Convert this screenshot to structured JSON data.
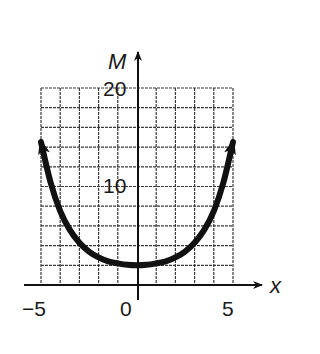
{
  "chart_data": {
    "type": "line",
    "title": "",
    "xlabel": "x",
    "ylabel": "M",
    "xlim": [
      -5,
      5
    ],
    "ylim": [
      0,
      20
    ],
    "grid": true,
    "grid_step_x": 1,
    "grid_step_y": 2,
    "x_tick_labels": [
      "−5",
      "0",
      "5"
    ],
    "y_tick_labels": [
      "10",
      "20"
    ],
    "series": [
      {
        "name": "M(x)",
        "x": [
          -5,
          -4.5,
          -4,
          -3.5,
          -3,
          -2.5,
          -2,
          -1.5,
          -1,
          -0.5,
          0,
          0.5,
          1,
          1.5,
          2,
          2.5,
          3,
          3.5,
          4,
          4.5,
          5
        ],
        "values": [
          14.5,
          10.4,
          7.5,
          5.6,
          4.3,
          3.4,
          2.8,
          2.4,
          2.2,
          2.05,
          2,
          2.05,
          2.2,
          2.4,
          2.8,
          3.4,
          4.3,
          5.6,
          7.5,
          10.4,
          14.5
        ],
        "arrow_ends": true
      }
    ]
  },
  "colors": {
    "curve": "#111111",
    "grid": "#3a3a3a",
    "axis": "#111111",
    "text": "#1a1a1a"
  },
  "labels": {
    "y_axis_name": "M",
    "x_axis_name": "x",
    "y_tick_20": "20",
    "y_tick_10": "10",
    "x_tick_neg5": "−5",
    "x_tick_0": "0",
    "x_tick_5": "5"
  }
}
